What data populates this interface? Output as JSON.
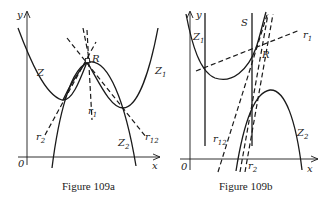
{
  "figures": [
    {
      "id": "109a",
      "caption": "Figure 109a",
      "axis_labels": {
        "x": "x",
        "y": "y",
        "origin": "0"
      },
      "curve_labels": {
        "Z": "Z",
        "Z1": {
          "base": "Z",
          "sub": "1"
        },
        "Z2": {
          "base": "Z",
          "sub": "2"
        },
        "R": "R",
        "r1": {
          "base": "r",
          "sub": "1"
        },
        "r2": {
          "base": "r",
          "sub": "2"
        },
        "r12": {
          "base": "r",
          "sub": "12"
        }
      }
    },
    {
      "id": "109b",
      "caption": "Figure 109b",
      "axis_labels": {
        "x": "x",
        "y": "y",
        "origin": "0"
      },
      "curve_labels": {
        "S": "S",
        "Z1": {
          "base": "Z",
          "sub": "1"
        },
        "Z2": {
          "base": "Z",
          "sub": "2"
        },
        "R": "R",
        "r1": {
          "base": "r",
          "sub": "1"
        },
        "r2": {
          "base": "r",
          "sub": "2"
        },
        "r12": {
          "base": "r",
          "sub": "12"
        }
      }
    }
  ]
}
